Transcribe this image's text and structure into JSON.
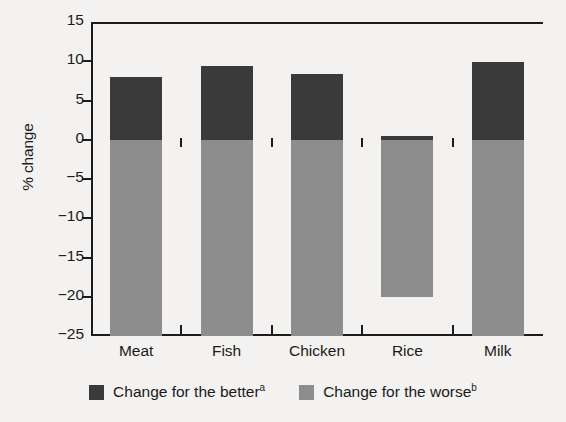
{
  "chart_data": {
    "type": "bar",
    "title": "",
    "subtitle": "",
    "xlabel": "",
    "ylabel": "% change",
    "categories": [
      "Meat",
      "Fish",
      "Chicken",
      "Rice",
      "Milk"
    ],
    "series": [
      {
        "name": "Change for the better",
        "superscript": "a",
        "color": "#3a3a3a",
        "values": [
          8.0,
          9.4,
          8.4,
          0.5,
          9.9
        ]
      },
      {
        "name": "Change for the worse",
        "superscript": "b",
        "color": "#8d8d8d",
        "values": [
          -25.0,
          -25.0,
          -25.0,
          -20.0,
          -25.0
        ]
      }
    ],
    "ylim": [
      -25,
      15
    ],
    "yticks": [
      15,
      10,
      5,
      0,
      -5,
      -10,
      -15,
      -20,
      -25
    ],
    "ytick_labels": [
      "15",
      "10",
      "5",
      "0",
      "−5",
      "−10",
      "−15",
      "−20",
      "−25"
    ],
    "grid": false,
    "legend_position": "bottom",
    "zero_line": 0
  },
  "legend": {
    "items": [
      {
        "label": "Change for the better",
        "superscript": "a",
        "swatch": "better"
      },
      {
        "label": "Change for the worse",
        "superscript": "b",
        "swatch": "worse"
      }
    ]
  },
  "colors": {
    "background": "#f3f2f0",
    "axis": "#1c1c1c",
    "positive_bar": "#3a3a3a",
    "negative_bar": "#8d8d8d"
  }
}
